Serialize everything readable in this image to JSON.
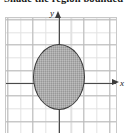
{
  "instruction": {
    "text": "Shade the region bounded"
  },
  "figure": {
    "y_axis_label": "y",
    "x_axis_label": "x",
    "y_arrow_icon": "arrow-up-icon",
    "x_arrow_icon": "arrow-right-icon",
    "shaded_region_name": "shaded-ellipse"
  },
  "colors": {
    "axis": "#4a4a4a",
    "grid_minor": "#e2e2e2",
    "grid_major": "#b9b9b9",
    "ellipse_fill": "#a9a9a9",
    "ellipse_stroke": "#3a3a3a",
    "frame": "#c8c8c8",
    "text": "#1a1a1a"
  },
  "chart_data": {
    "type": "scatter",
    "title": "Shade the region bounded",
    "xlabel": "x",
    "ylabel": "y",
    "grid": true,
    "legend": "none",
    "xlim": [
      -4.5,
      4.5
    ],
    "ylim": [
      -5.5,
      5.5
    ],
    "xticks": [
      -4,
      -3,
      -2,
      -1,
      0,
      1,
      2,
      3,
      4
    ],
    "yticks": [
      -5,
      -4,
      -3,
      -2,
      -1,
      0,
      1,
      2,
      3,
      4,
      5
    ],
    "xticklabels": [
      "",
      "",
      "",
      "",
      "",
      "",
      "",
      "",
      ""
    ],
    "yticklabels": [
      "",
      "",
      "",
      "",
      "",
      "",
      "",
      "",
      "",
      "",
      ""
    ],
    "shapes": [
      {
        "kind": "ellipse",
        "center_x": 0,
        "center_y": 0,
        "semi_axis_x": 2,
        "semi_axis_y": 2.6,
        "filled": true,
        "fill": "#a9a9a9",
        "stroke": "#3a3a3a"
      }
    ]
  }
}
